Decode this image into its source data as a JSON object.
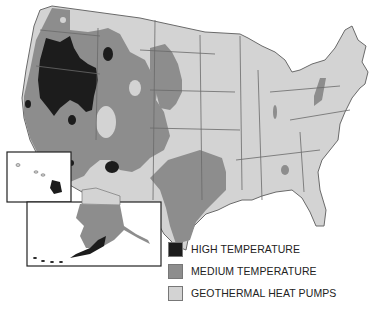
{
  "map": {
    "type": "choropleth",
    "region": "United States",
    "insets": [
      "Hawaii",
      "Alaska"
    ]
  },
  "colors": {
    "high": "#1c1c1c",
    "medium": "#8d8d8d",
    "low": "#d3d3d3",
    "border": "#6a6a6a"
  },
  "legend": {
    "items": [
      {
        "label": "HIGH TEMPERATURE",
        "color": "#1c1c1c"
      },
      {
        "label": "MEDIUM TEMPERATURE",
        "color": "#8d8d8d"
      },
      {
        "label": "GEOTHERMAL HEAT PUMPS",
        "color": "#d3d3d3"
      }
    ]
  }
}
